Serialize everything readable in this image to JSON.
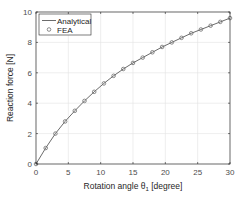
{
  "chart_data": {
    "type": "line",
    "title": "",
    "xlabel": "Rotation angle θ1 [degree]",
    "ylabel": "Reaction force [N]",
    "xlim": [
      0,
      30
    ],
    "ylim": [
      0,
      10
    ],
    "xticks": [
      0,
      5,
      10,
      15,
      20,
      25,
      30
    ],
    "yticks": [
      0,
      2,
      4,
      6,
      8,
      10
    ],
    "grid": true,
    "legend_position": "upper left",
    "legend": [
      "Analytical",
      "FEA"
    ],
    "series": [
      {
        "name": "Analytical",
        "style": "line",
        "x": [
          0,
          1.5,
          3,
          4.5,
          6,
          7.5,
          9,
          10.5,
          12,
          13.5,
          15,
          16.5,
          18,
          19.5,
          21,
          22.5,
          24,
          25.5,
          27,
          28.5,
          30
        ],
        "y": [
          0,
          1.05,
          2.0,
          2.8,
          3.5,
          4.15,
          4.75,
          5.3,
          5.8,
          6.25,
          6.65,
          7.0,
          7.35,
          7.7,
          8.0,
          8.3,
          8.6,
          8.85,
          9.1,
          9.35,
          9.6
        ]
      },
      {
        "name": "FEA",
        "style": "marker-circle",
        "x": [
          0,
          1.5,
          3,
          4.5,
          6,
          7.5,
          9,
          10.5,
          12,
          13.5,
          15,
          16.5,
          18,
          19.5,
          21,
          22.5,
          24,
          25.5,
          27,
          28.5,
          30
        ],
        "y": [
          0,
          1.05,
          2.0,
          2.8,
          3.5,
          4.15,
          4.75,
          5.3,
          5.8,
          6.25,
          6.65,
          7.0,
          7.35,
          7.7,
          8.0,
          8.3,
          8.6,
          8.85,
          9.1,
          9.35,
          9.6
        ]
      }
    ]
  },
  "axes": {
    "xlabel_main": "Rotation angle θ",
    "xlabel_sub": "1",
    "xlabel_tail": " [degree]",
    "ylabel": "Reaction force [N]"
  },
  "legend": {
    "analytical_label": "Analytical",
    "fea_label": "FEA"
  },
  "colors": {
    "line": "#5a5a5a",
    "marker": "#6e6e6e",
    "grid": "#e3e3e3",
    "axis": "#262626"
  }
}
